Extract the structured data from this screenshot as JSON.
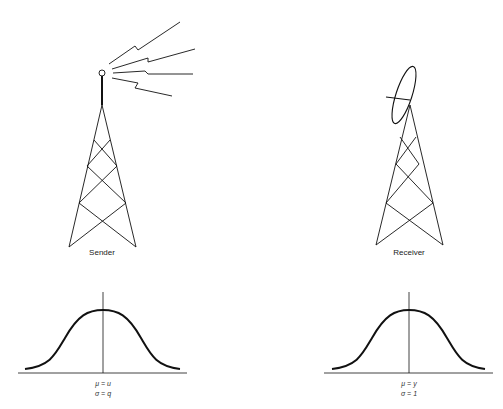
{
  "sender": {
    "label": "Sender",
    "distribution": {
      "mu": "μ = u",
      "sigma": "σ = q"
    }
  },
  "receiver": {
    "label": "Receiver",
    "distribution": {
      "mu": "μ = y",
      "sigma": "σ = 1"
    }
  },
  "colors": {
    "stroke": "#111111",
    "background": "#ffffff"
  }
}
